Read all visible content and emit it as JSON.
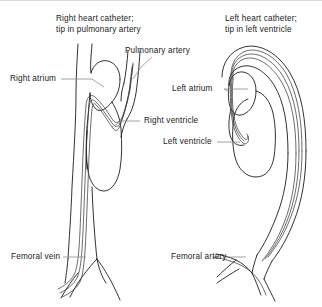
{
  "figure": {
    "kind": "anatomical-line-diagram",
    "background_color": "#ffffff",
    "line_color": "#1a1a1a",
    "leader_color": "#8c8c8c",
    "text_color": "#1a1a1a"
  },
  "titles": {
    "left": "Right heart catheter;\ntip in pulmonary artery",
    "right": "Left heart catheter;\ntip in left ventricle"
  },
  "labels": {
    "right_atrium": "Right atrium",
    "pulmonary_artery": "Pulmonary artery",
    "right_ventricle": "Right ventricle",
    "femoral_vein": "Femoral vein",
    "left_atrium": "Left atrium",
    "left_ventricle": "Left ventricle",
    "femoral_artery": "Femoral artery"
  }
}
